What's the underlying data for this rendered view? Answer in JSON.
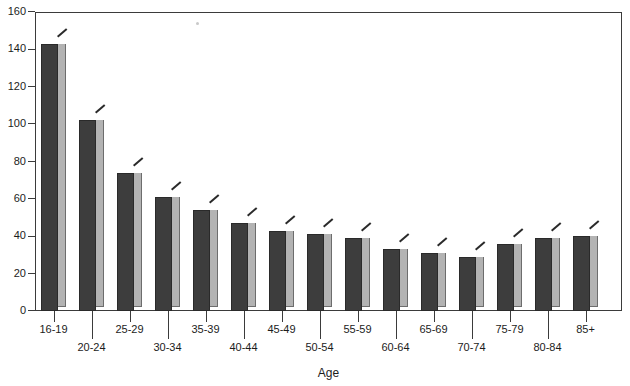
{
  "chart_data": {
    "type": "bar",
    "title": "",
    "xlabel": "Age",
    "ylabel": "",
    "categories": [
      "16-19",
      "20-24",
      "25-29",
      "30-34",
      "35-39",
      "40-44",
      "45-49",
      "50-54",
      "55-59",
      "60-64",
      "65-69",
      "70-74",
      "75-79",
      "80-84",
      "85+"
    ],
    "values": [
      143,
      102,
      74,
      61,
      54,
      47,
      43,
      41,
      39,
      33,
      31,
      29,
      36,
      39,
      40
    ],
    "ylim": [
      0,
      160
    ],
    "yticks": [
      0,
      20,
      40,
      60,
      80,
      100,
      120,
      140,
      160
    ],
    "ytick_labels": [
      "0",
      "20",
      "40",
      "60",
      "80",
      "100",
      "120",
      "140",
      "160"
    ],
    "grid": false,
    "legend": null,
    "bar_style": "3d-extruded",
    "colors": {
      "bar_front": "#3d3d3d",
      "bar_side": "#b3b3b3",
      "axis": "#3b3b3b",
      "text": "#1c1c1c",
      "background": "#ffffff"
    }
  },
  "axis": {
    "x_title": "Age"
  }
}
